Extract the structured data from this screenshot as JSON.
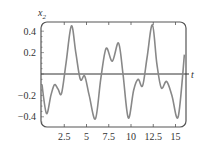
{
  "chart_data": {
    "type": "line",
    "title": "",
    "xlabel": "t",
    "ylabel": "x2",
    "xlim": [
      0,
      16
    ],
    "ylim": [
      -0.5,
      0.5
    ],
    "grid": false,
    "legend": null,
    "xticks": [
      2.5,
      5,
      7.5,
      10,
      12.5,
      15
    ],
    "xtick_labels": [
      "2.5",
      "5",
      "7.5",
      "10",
      "12.5",
      "15"
    ],
    "yticks": [
      0.4,
      0.2,
      -0.2,
      -0.4
    ],
    "ytick_labels": [
      "0.4",
      "0.2",
      "-0.2",
      "-0.4"
    ],
    "series": [
      {
        "name": "x2(t)",
        "color": "#888888",
        "x": [
          0,
          0.5,
          1.0,
          1.4,
          1.8,
          2.2,
          2.7,
          3.3,
          3.8,
          4.3,
          4.8,
          5.3,
          6.0,
          6.6,
          7.2,
          7.9,
          8.6,
          9.1,
          9.7,
          10.3,
          10.8,
          11.3,
          11.8,
          12.4,
          12.9,
          13.4,
          14.0,
          14.6,
          15.3,
          16.0
        ],
        "values": [
          -0.1,
          -0.37,
          -0.2,
          -0.1,
          -0.14,
          -0.18,
          0.1,
          0.45,
          0.2,
          -0.05,
          -0.02,
          -0.2,
          -0.42,
          -0.05,
          0.24,
          0.12,
          0.29,
          0.0,
          -0.41,
          -0.15,
          -0.05,
          -0.11,
          0.15,
          0.46,
          0.1,
          -0.13,
          -0.07,
          -0.2,
          -0.4,
          0.18
        ]
      }
    ]
  },
  "labels": {
    "x_axis": "t",
    "y_axis_base": "x",
    "y_axis_sub": "2"
  }
}
